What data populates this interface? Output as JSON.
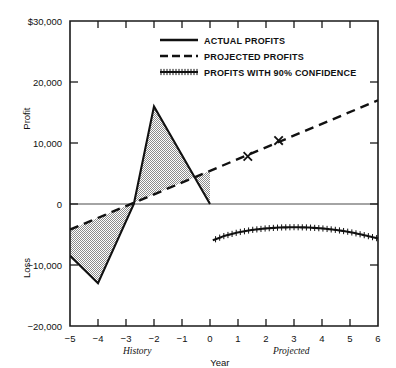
{
  "chart_data": {
    "type": "line",
    "title": "",
    "xlabel": "Year",
    "ylabel_upper": "Profit",
    "ylabel_lower": "Loss",
    "grid": false,
    "xlim": [
      -5,
      6
    ],
    "ylim": [
      -20000,
      30000
    ],
    "x_ticks": [
      -5,
      -4,
      -3,
      -2,
      -1,
      0,
      1,
      2,
      3,
      4,
      5,
      6
    ],
    "x_tick_labels": [
      "−5",
      "−4",
      "−3",
      "−2",
      "−1",
      "0",
      "1",
      "2",
      "3",
      "4",
      "5",
      "6"
    ],
    "y_ticks": [
      30000,
      20000,
      10000,
      0,
      -10000,
      -20000
    ],
    "y_tick_labels": [
      "$30,000",
      "20,000",
      "10,000",
      "0",
      "−10,000",
      "−20,000"
    ],
    "era_labels": [
      {
        "text": "History",
        "x": -2.6
      },
      {
        "text": "Projected",
        "x": 2.9
      }
    ],
    "legend": {
      "position": "top-center",
      "entries": [
        {
          "label": "ACTUAL PROFITS",
          "style": "solid"
        },
        {
          "label": "PROJECTED PROFITS",
          "style": "dashed"
        },
        {
          "label": "PROFITS WITH 90% CONFIDENCE",
          "style": "hatched"
        }
      ]
    },
    "series": [
      {
        "name": "ACTUAL PROFITS",
        "style": "solid",
        "x": [
          -5,
          -4,
          -2.72,
          -2,
          0
        ],
        "values": [
          -8500,
          -13000,
          0,
          16000,
          0
        ]
      },
      {
        "name": "PROJECTED PROFITS",
        "style": "dashed",
        "x": [
          -5,
          6
        ],
        "values": [
          -4200,
          17000
        ],
        "markers": [
          {
            "x": 1.35,
            "y": 7800,
            "symbol": "x"
          },
          {
            "x": 2.45,
            "y": 10400,
            "symbol": "x"
          }
        ]
      },
      {
        "name": "PROFITS WITH 90% CONFIDENCE",
        "style": "hatched",
        "x": [
          0.1,
          0.5,
          1.0,
          1.5,
          2.0,
          2.5,
          3.0,
          3.5,
          4.0,
          4.5,
          5.0,
          5.5,
          6.0
        ],
        "values": [
          -5950,
          -5250,
          -4650,
          -4250,
          -4000,
          -3850,
          -3800,
          -3850,
          -4000,
          -4250,
          -4600,
          -5100,
          -5650
        ]
      }
    ],
    "shaded_band": {
      "name": "uncertainty-band-history",
      "fill_color": "#a9a9a9",
      "description": "Hatched region between actual profits and projected profits from year -5 to year 0"
    }
  }
}
